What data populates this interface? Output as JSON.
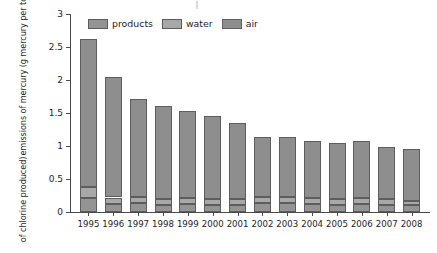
{
  "chart_data": {
    "type": "bar",
    "subtype": "stacked-bar",
    "title": "",
    "xlabel": "",
    "ylabel": "emissions of mercury (g mercury per tonne of chlorine produced)",
    "ylabel_line1": "emissions of mercury (g mercury per tonne",
    "ylabel_line2": "of chlorine produced)",
    "ylim": [
      0,
      3
    ],
    "yticks": [
      0,
      0.5,
      1,
      1.5,
      2,
      2.5,
      3
    ],
    "ytick_labels": [
      "0",
      "0.5",
      "1",
      "1.5",
      "2",
      "2.5",
      "3"
    ],
    "grid": false,
    "legend_position": "top",
    "categories": [
      "1995",
      "1996",
      "1997",
      "1998",
      "1999",
      "2000",
      "2001",
      "2002",
      "2003",
      "2004",
      "2005",
      "2006",
      "2007",
      "2008"
    ],
    "series": [
      {
        "name": "products",
        "color": "#949494",
        "values": [
          0.21,
          0.12,
          0.14,
          0.11,
          0.12,
          0.11,
          0.11,
          0.13,
          0.13,
          0.12,
          0.11,
          0.12,
          0.11,
          0.1
        ]
      },
      {
        "name": "water",
        "color": "#a8a8a8",
        "values": [
          0.17,
          0.1,
          0.09,
          0.09,
          0.09,
          0.09,
          0.08,
          0.09,
          0.09,
          0.09,
          0.08,
          0.09,
          0.08,
          0.07
        ]
      },
      {
        "name": "air",
        "color": "#8e8e8e",
        "values": [
          2.24,
          1.83,
          1.49,
          1.4,
          1.32,
          1.25,
          1.16,
          0.91,
          0.92,
          0.87,
          0.86,
          0.86,
          0.79,
          0.79
        ]
      }
    ],
    "totals": [
      2.62,
      2.05,
      1.72,
      1.6,
      1.53,
      1.45,
      1.35,
      1.13,
      1.14,
      1.08,
      1.05,
      1.07,
      0.98,
      0.96
    ]
  },
  "legend": {
    "items": [
      {
        "label": "products",
        "swatch": "products-swatch"
      },
      {
        "label": "water",
        "swatch": "water-swatch"
      },
      {
        "label": "air",
        "swatch": "air-swatch"
      }
    ]
  },
  "colors": {
    "air": "#8e8e8e",
    "water": "#a8a8a8",
    "products": "#949494",
    "axis": "#4a4a4a",
    "text": "#1d1d1d",
    "background": "#ffffff"
  }
}
